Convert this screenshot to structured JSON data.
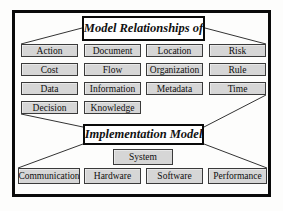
{
  "figure": {
    "top_title": "Model Relationships of",
    "bottom_title": "Implementation Model",
    "grid": [
      [
        "Action",
        "Document",
        "Location",
        "Risk"
      ],
      [
        "Cost",
        "Flow",
        "Organization",
        "Rule"
      ],
      [
        "Data",
        "Information",
        "Metadata",
        "Time"
      ],
      [
        "Decision",
        "Knowledge"
      ]
    ],
    "system_label": "System",
    "bottom_row": [
      "Communication",
      "Hardware",
      "Software",
      "Performance"
    ],
    "colors": {
      "background": "#fdfdfc",
      "frame": "#0a0a0a",
      "line": "#333333",
      "box_fill": "#d6d6d6",
      "box_border": "#3a3a3a",
      "title_fill": "#ffffff"
    }
  }
}
